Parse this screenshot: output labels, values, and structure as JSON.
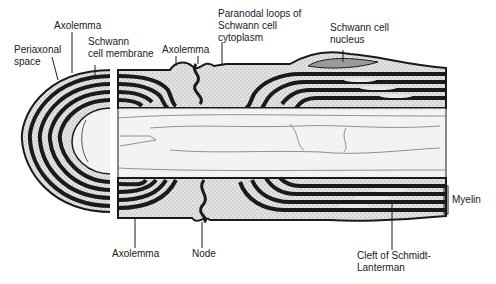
{
  "diagram": {
    "type": "anatomical cross-section",
    "labels": {
      "periaxonal_space": [
        "Periaxonal",
        "space"
      ],
      "axolemma_top_left": "Axolemma",
      "schwann_cell_membrane": [
        "Schwann",
        "cell membrane"
      ],
      "axolemma_top_mid": "Axolemma",
      "paranodal_loops": [
        "Paranodal loops of",
        "Schwann cell",
        "cytoplasm"
      ],
      "schwann_cell_nucleus": [
        "Schwann cell",
        "nucleus"
      ],
      "myelin": "Myelin",
      "axolemma_bottom": "Axolemma",
      "node": "Node",
      "cleft": [
        "Cleft of Schmidt-",
        "Lanterman"
      ]
    },
    "colors": {
      "ink": "#1a1a1a",
      "stipple": "#cfcfcf",
      "axoplasm": "#f2f2f2",
      "background": "#ffffff"
    }
  }
}
